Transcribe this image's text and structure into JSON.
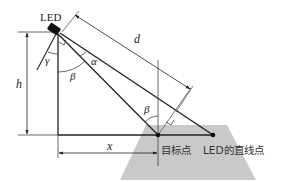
{
  "diagram": {
    "type": "geometry",
    "colors": {
      "line": "#222222",
      "ground": "#c8c8c8",
      "led": "#111111"
    },
    "labels": {
      "led": "LED",
      "d": "d",
      "h": "h",
      "x": "x",
      "alpha": "α",
      "beta_top": "β",
      "beta_bottom": "β",
      "gamma": "γ",
      "target_point": "目标点",
      "led_direct_point": "LED的直线点"
    },
    "nodes": [
      {
        "id": "led",
        "label": "LED"
      },
      {
        "id": "target_point",
        "label": "目标点"
      },
      {
        "id": "led_direct_point",
        "label": "LED的直线点"
      }
    ],
    "edges": [
      {
        "from": "led",
        "to": "target_point",
        "label": "d"
      },
      {
        "from": "led",
        "to": "led_direct_point"
      }
    ],
    "dimensions": [
      {
        "name": "h",
        "meaning": "LED height"
      },
      {
        "name": "x",
        "meaning": "horizontal distance to target"
      },
      {
        "name": "d",
        "meaning": "distance along LED axis"
      }
    ],
    "angles": [
      "α",
      "β",
      "β",
      "γ"
    ]
  }
}
